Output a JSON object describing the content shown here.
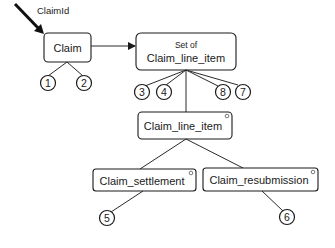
{
  "entry": {
    "label": "ClaimId"
  },
  "nodes": {
    "claim": {
      "label": "Claim"
    },
    "set_of_claim_line_item": {
      "prefix": "Set of",
      "label": "Claim_line_item"
    },
    "claim_line_item": {
      "label": "Claim_line_item"
    },
    "claim_settlement": {
      "label": "Claim_settlement"
    },
    "claim_resubmission": {
      "label": "Claim_resubmission"
    }
  },
  "markers": [
    "1",
    "2",
    "3",
    "4",
    "8",
    "7",
    "5",
    "6"
  ],
  "colors": {
    "stroke": "#1a1a1a",
    "background": "#ffffff"
  }
}
